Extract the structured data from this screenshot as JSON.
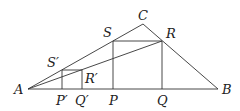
{
  "diagram": {
    "points": {
      "A": {
        "label": "A",
        "x": 28,
        "y": 89
      },
      "B": {
        "label": "B",
        "x": 218,
        "y": 89
      },
      "C": {
        "label": "C",
        "x": 143,
        "y": 24
      },
      "S": {
        "label": "S",
        "x": 113,
        "y": 41
      },
      "R": {
        "label": "R",
        "x": 162,
        "y": 41
      },
      "P": {
        "label": "P",
        "x": 113,
        "y": 89
      },
      "Q": {
        "label": "Q",
        "x": 162,
        "y": 89
      },
      "S_prime": {
        "label": "S′",
        "x": 62,
        "y": 70
      },
      "R_prime": {
        "label": "R′",
        "x": 82,
        "y": 70
      },
      "P_prime": {
        "label": "P′",
        "x": 62,
        "y": 89
      },
      "Q_prime": {
        "label": "Q′",
        "x": 82,
        "y": 89
      }
    },
    "segments": [
      [
        "A",
        "B"
      ],
      [
        "A",
        "C"
      ],
      [
        "C",
        "B"
      ],
      [
        "S",
        "R"
      ],
      [
        "S",
        "P"
      ],
      [
        "R",
        "Q"
      ],
      [
        "S_prime",
        "R_prime"
      ],
      [
        "S_prime",
        "P_prime"
      ],
      [
        "R_prime",
        "Q_prime"
      ],
      [
        "A",
        "R"
      ]
    ],
    "line_color": "#333333"
  }
}
